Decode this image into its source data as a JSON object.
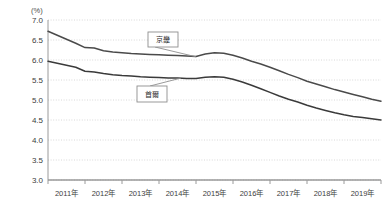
{
  "chart_data": {
    "type": "line",
    "title": "",
    "xlabel": "",
    "ylabel": "",
    "unit_label": "(%)",
    "ylim": [
      3.0,
      7.0
    ],
    "ytick_values": [
      3.0,
      3.5,
      4.0,
      4.5,
      5.0,
      5.5,
      6.0,
      6.5,
      7.0
    ],
    "ytick_labels": [
      "3.0",
      "3.5",
      "4.0",
      "4.5",
      "5.0",
      "5.5",
      "6.0",
      "6.5",
      "7.0"
    ],
    "categories": [
      "2011年",
      "2012年",
      "2013年",
      "2014年",
      "2015年",
      "2016年",
      "2017年",
      "2018年",
      "2019年"
    ],
    "xlim": [
      2011.0,
      2020.0
    ],
    "grid": true,
    "grid_style": "dotted",
    "legend_position": "inline-callout",
    "series": [
      {
        "name": "京畿",
        "color": "#4a4a4a",
        "label_anchor_x": 2015.0,
        "label_anchor_y": 6.08,
        "x": [
          2011.0,
          2011.25,
          2011.5,
          2011.75,
          2012.0,
          2012.25,
          2012.5,
          2012.75,
          2013.0,
          2013.25,
          2013.5,
          2013.75,
          2014.0,
          2014.25,
          2014.5,
          2014.75,
          2015.0,
          2015.25,
          2015.5,
          2015.75,
          2016.0,
          2016.25,
          2016.5,
          2016.75,
          2017.0,
          2017.25,
          2017.5,
          2017.75,
          2018.0,
          2018.25,
          2018.5,
          2018.75,
          2019.0,
          2019.25,
          2019.5,
          2019.75,
          2020.0
        ],
        "values": [
          6.72,
          6.62,
          6.52,
          6.42,
          6.31,
          6.3,
          6.23,
          6.2,
          6.18,
          6.16,
          6.15,
          6.14,
          6.13,
          6.12,
          6.11,
          6.1,
          6.09,
          6.15,
          6.18,
          6.17,
          6.12,
          6.05,
          5.97,
          5.9,
          5.82,
          5.73,
          5.64,
          5.56,
          5.47,
          5.4,
          5.33,
          5.26,
          5.2,
          5.14,
          5.08,
          5.02,
          4.97
        ]
      },
      {
        "name": "首爾",
        "color": "#3a3a3a",
        "label_anchor_x": 2014.6,
        "label_anchor_y": 5.55,
        "x": [
          2011.0,
          2011.25,
          2011.5,
          2011.75,
          2012.0,
          2012.25,
          2012.5,
          2012.75,
          2013.0,
          2013.25,
          2013.5,
          2013.75,
          2014.0,
          2014.25,
          2014.5,
          2014.75,
          2015.0,
          2015.25,
          2015.5,
          2015.75,
          2016.0,
          2016.25,
          2016.5,
          2016.75,
          2017.0,
          2017.25,
          2017.5,
          2017.75,
          2018.0,
          2018.25,
          2018.5,
          2018.75,
          2019.0,
          2019.25,
          2019.5,
          2019.75,
          2020.0
        ],
        "values": [
          5.97,
          5.92,
          5.87,
          5.82,
          5.72,
          5.7,
          5.66,
          5.63,
          5.61,
          5.6,
          5.58,
          5.57,
          5.56,
          5.55,
          5.55,
          5.54,
          5.54,
          5.57,
          5.58,
          5.57,
          5.52,
          5.45,
          5.37,
          5.28,
          5.19,
          5.1,
          5.02,
          4.95,
          4.87,
          4.8,
          4.74,
          4.68,
          4.63,
          4.59,
          4.56,
          4.53,
          4.5
        ]
      }
    ],
    "colors": {
      "axis": "#9a9a9a",
      "grid": "#d8d8d8",
      "series_primary": "#4a4a4a",
      "series_secondary": "#3a3a3a",
      "callout_border": "#8e8e8e",
      "callout_fill": "#ffffff",
      "background": "#ffffff"
    }
  },
  "callouts": [
    {
      "label": "京畿"
    },
    {
      "label": "首爾"
    }
  ]
}
